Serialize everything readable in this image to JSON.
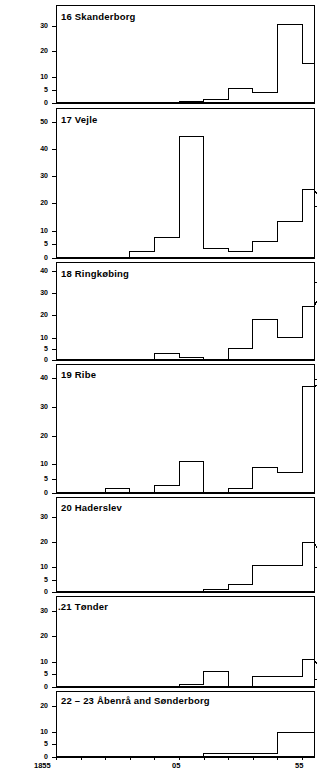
{
  "figure": {
    "width": 317,
    "height": 770,
    "background": "#ffffff",
    "line_color": "#000000"
  },
  "xaxis": {
    "labels": [
      "1855",
      "05",
      "55"
    ],
    "label_years": [
      1855,
      1905,
      1955
    ],
    "tick_interval_years": 10,
    "range": [
      1855,
      1965
    ],
    "tick_years": [
      1855,
      1865,
      1875,
      1885,
      1895,
      1905,
      1915,
      1925,
      1935,
      1945,
      1955,
      1965
    ]
  },
  "chart_data": {
    "type": "bar",
    "title": "",
    "xlabel": "",
    "ylabel": "",
    "grid": false,
    "legend": "none",
    "shared_x_categories": [
      "1855",
      "1865",
      "1875",
      "1885",
      "1895",
      "1905",
      "1915",
      "1925",
      "1935",
      "1945",
      "1955"
    ],
    "x_bin_starts": [
      1855,
      1865,
      1875,
      1885,
      1895,
      1905,
      1915,
      1925,
      1935,
      1945,
      1955
    ],
    "xlim": [
      1855,
      1965
    ],
    "panels": [
      {
        "number": "16",
        "name": "Skanderborg",
        "title": "16  Skanderborg",
        "yticks": [
          0,
          5,
          10,
          20,
          30
        ],
        "ylim": [
          0,
          38
        ],
        "values": [
          0,
          0,
          0,
          0,
          0,
          0.6,
          1.5,
          5.5,
          4,
          30.5,
          15.5
        ]
      },
      {
        "number": "17",
        "name": "Vejle",
        "title": "17  Vejle",
        "yticks": [
          0,
          5,
          10,
          20,
          30,
          40,
          50
        ],
        "ylim": [
          0,
          55
        ],
        "values": [
          0,
          0,
          0,
          2.5,
          7.5,
          44.5,
          3.5,
          2.5,
          6,
          13.5,
          25,
          19
        ]
      },
      {
        "number": "18",
        "name": "Ringkøbing",
        "title": "18  Ringkøbing",
        "yticks": [
          0,
          5,
          10,
          20,
          30,
          40
        ],
        "ylim": [
          0,
          44
        ],
        "values": [
          0,
          0,
          0,
          0,
          3,
          1,
          0,
          5,
          18,
          10,
          24,
          35
        ]
      },
      {
        "number": "19",
        "name": "Ribe",
        "title": "19  Ribe",
        "yticks": [
          0,
          5,
          10,
          20,
          30,
          40
        ],
        "ylim": [
          0,
          45
        ],
        "values": [
          0,
          0,
          1.5,
          0,
          2.5,
          11,
          0,
          1.5,
          9,
          7,
          37,
          39.5
        ]
      },
      {
        "number": "20",
        "name": "Haderslev",
        "title": "20  Haderslev",
        "yticks": [
          0,
          5,
          10,
          20,
          30
        ],
        "ylim": [
          0,
          38
        ],
        "values": [
          0,
          0,
          0,
          0,
          0,
          0,
          1,
          3,
          10.5,
          10.5,
          20,
          10
        ]
      },
      {
        "number": ".21",
        "name": "Tønder",
        "title": ".21  Tønder",
        "yticks": [
          0,
          5,
          10,
          20,
          30
        ],
        "ylim": [
          0,
          36
        ],
        "values": [
          0,
          0,
          0,
          0,
          0,
          1,
          6,
          0,
          4,
          4,
          11,
          3
        ]
      },
      {
        "number": "22-23",
        "name": "Åbenrå and Sønderborg",
        "title": "22 – 23   Åbenrå and Sønderborg",
        "yticks": [
          0,
          5,
          10,
          20
        ],
        "ylim": [
          0,
          26
        ],
        "values": [
          0,
          0,
          0,
          0,
          0,
          0,
          1.5,
          1.5,
          1.5,
          9.5,
          9.5,
          0
        ]
      }
    ]
  }
}
